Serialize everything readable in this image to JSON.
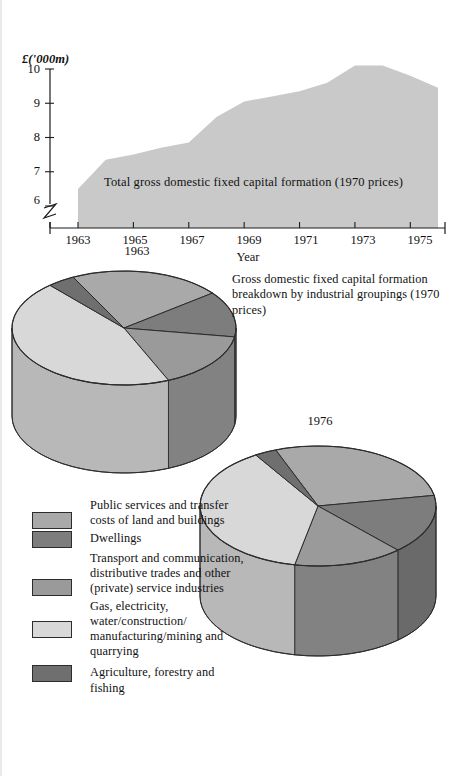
{
  "figure": {
    "background": "#ffffff",
    "ink": "#111111"
  },
  "palette": {
    "area_fill": "#c9c9c9",
    "public_services": "#a9a9a9",
    "dwellings": "#7d7d7d",
    "transport": "#9a9a9a",
    "gas_electricity": "#d8d8d8",
    "agriculture": "#6f6f6f",
    "side_public_services": "#8f8f8f",
    "side_dwellings": "#6a6a6a",
    "side_transport": "#828282",
    "side_gas": "#b8b8b8",
    "side_agriculture": "#5c5c5c",
    "outline": "#2c2c2c"
  },
  "area_chart": {
    "y_unit_label": "£('000m)",
    "x_axis_title": "Year",
    "series_label": "Total gross domestic fixed capital formation (1970 prices)",
    "y_ticks": [
      "10",
      "9",
      "8",
      "7",
      "6"
    ],
    "x_ticks": [
      "1963",
      "1965",
      "1967",
      "1969",
      "1971",
      "1973",
      "1975"
    ],
    "axis_break": true
  },
  "pies_note": "Gross domestic fixed capital formation breakdown by industrial groupings (1970 prices)",
  "pie_1963_year": "1963",
  "pie_1976_year": "1976",
  "legend": {
    "items": [
      {
        "key": "public_services",
        "label": "Public services and transfer costs of land and buildings"
      },
      {
        "key": "dwellings",
        "label": "Dwellings"
      },
      {
        "key": "transport",
        "label": "Transport and communication, distributive trades and other (private) service industries"
      },
      {
        "key": "gas_electricity",
        "label": "Gas, electricity, water/construction/ manufacturing/mining and quarrying"
      },
      {
        "key": "agriculture",
        "label": "Agriculture, forestry and fishing"
      }
    ]
  },
  "chart_data": [
    {
      "type": "area",
      "title": "Total gross domestic fixed capital formation (1970 prices)",
      "xlabel": "Year",
      "ylabel": "£('000m)",
      "ylim": [
        5.4,
        10.2
      ],
      "xlim": [
        1963,
        1976
      ],
      "grid": false,
      "legend_position": "inside",
      "axis_break_y_below": 6,
      "x": [
        1963,
        1964,
        1965,
        1966,
        1967,
        1968,
        1969,
        1970,
        1971,
        1972,
        1973,
        1974,
        1975,
        1976
      ],
      "values": [
        6.5,
        7.35,
        7.5,
        7.7,
        7.85,
        8.6,
        9.05,
        9.2,
        9.35,
        9.6,
        10.1,
        10.1,
        9.8,
        9.45
      ]
    },
    {
      "type": "pie",
      "title": "1963",
      "labels": [
        "Public services and transfer costs of land and buildings",
        "Dwellings",
        "Transport and communication, distributive trades and other (private) service industries",
        "Gas, electricity, water/construction/manufacturing/mining and quarrying",
        "Agriculture, forestry and fishing"
      ],
      "values": [
        22,
        13,
        16,
        45,
        4
      ],
      "units": "percent"
    },
    {
      "type": "pie",
      "title": "1976",
      "labels": [
        "Public services and transfer costs of land and buildings",
        "Dwellings",
        "Transport and communication, distributive trades and other (private) service industries",
        "Gas, electricity, water/construction/manufacturing/mining and quarrying",
        "Agriculture, forestry and fishing"
      ],
      "values": [
        28,
        16,
        15,
        38,
        3
      ],
      "units": "percent"
    }
  ]
}
